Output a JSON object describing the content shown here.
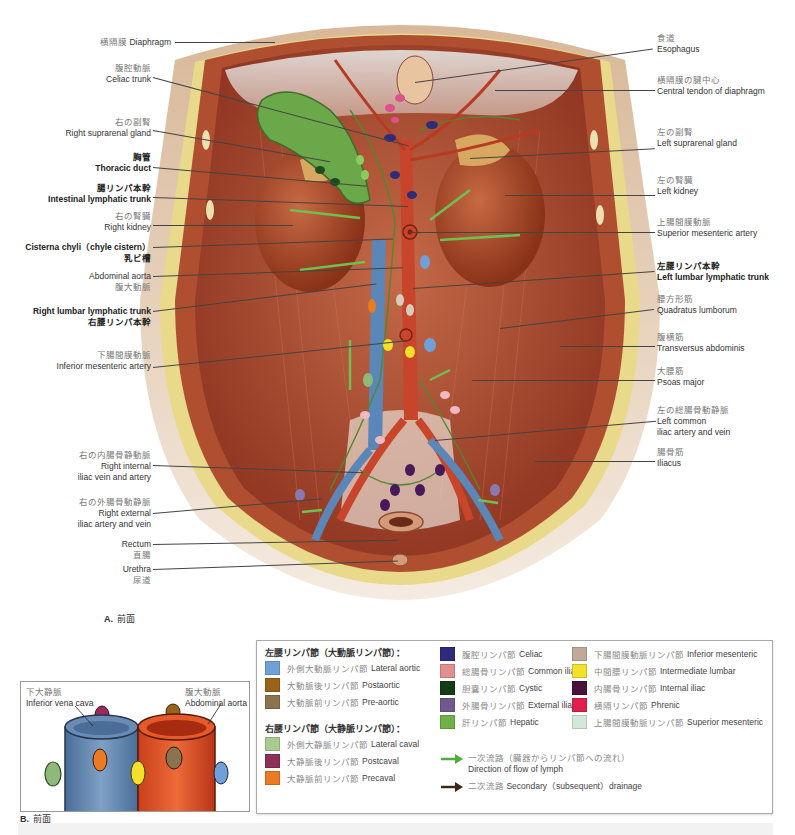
{
  "header": {
    "fragment_colour": "#b04a7a"
  },
  "figure_a": {
    "caption_letter": "A.",
    "caption_text": "前面",
    "left_labels": [
      {
        "jp": "横隔膜",
        "en": "Diaphragm",
        "bold": false,
        "inline": true
      },
      {
        "jp": "腹腔動脈",
        "en": "Celiac trunk",
        "bold": false
      },
      {
        "jp": "右の副腎",
        "en": "Right suprarenal gland",
        "bold": false
      },
      {
        "jp": "胸管",
        "en": "Thoracic duct",
        "bold": true
      },
      {
        "jp": "腸リンパ本幹",
        "en": "Intestinal lymphatic trunk",
        "bold": true
      },
      {
        "jp": "右の腎臓",
        "en": "Right kidney",
        "bold": false
      },
      {
        "en": "Cisterna chyli（chyle cistern）",
        "jp": "乳ビ槽",
        "bold": true,
        "en_first": true
      },
      {
        "en": "Abdominal aorta",
        "jp": "腹大動脈",
        "bold": false,
        "en_first": true
      },
      {
        "en": "Right lumbar lymphatic trunk",
        "jp": "右腰リンパ本幹",
        "bold": true,
        "en_first": true
      },
      {
        "jp": "下腸間膜動脈",
        "en": "Inferior mesenteric artery",
        "bold": false
      },
      {
        "jp": "右の内腸骨静動脈",
        "en": "Right internal",
        "en2": "iliac vein and artery",
        "bold": false
      },
      {
        "jp": "右の外腸骨動静脈",
        "en": "Right external",
        "en2": "iliac artery and vein",
        "bold": false
      },
      {
        "en": "Rectum",
        "jp": "直腸",
        "bold": false,
        "en_first": true
      },
      {
        "en": "Urethra",
        "jp": "尿道",
        "bold": false,
        "en_first": true
      }
    ],
    "right_labels": [
      {
        "jp": "食道",
        "en": "Esophagus",
        "bold": false
      },
      {
        "jp": "横隔膜の腱中心",
        "en": "Central tendon of diaphragm",
        "bold": false
      },
      {
        "jp": "左の副腎",
        "en": "Left suprarenal gland",
        "bold": false
      },
      {
        "jp": "左の腎臓",
        "en": "Left kidney",
        "bold": false
      },
      {
        "jp": "上腸間膜動脈",
        "en": "Superior mesenteric artery",
        "bold": false
      },
      {
        "jp": "左腰リンパ本幹",
        "en": "Left lumbar lymphatic trunk",
        "bold": true
      },
      {
        "jp": "腰方形筋",
        "en": "Quadratus lumborum",
        "bold": false
      },
      {
        "jp": "腹横筋",
        "en": "Transversus abdominis",
        "bold": false
      },
      {
        "jp": "大腰筋",
        "en": "Psoas major",
        "bold": false
      },
      {
        "jp": "左の総腸骨動静脈",
        "en": "Left common",
        "en2": "iliac artery and vein",
        "bold": false
      },
      {
        "jp": "腸骨筋",
        "en": "Iliacus",
        "bold": false
      }
    ]
  },
  "figure_b": {
    "caption_letter": "B.",
    "caption_text": "前面",
    "ivc_jp": "下大静脈",
    "ivc_en": "Inferior vena cava",
    "aorta_jp": "腹大動脈",
    "aorta_en": "Abdominal aorta"
  },
  "legend": {
    "left_group_title": "左腰リンパ節（大動脈リンパ節）：",
    "left_group": [
      {
        "jp": "外側大動脈リンパ節",
        "en": "Lateral aortic",
        "color": "#6fa0d8"
      },
      {
        "jp": "大動脈後リンパ節",
        "en": "Postaortic",
        "color": "#9a6418"
      },
      {
        "jp": "大動脈前リンパ節",
        "en": "Pre-aortic",
        "color": "#8c7350"
      }
    ],
    "right_group_title": "右腰リンパ節（大静脈リンパ節）：",
    "right_group": [
      {
        "jp": "外側大静脈リンパ節",
        "en": "Lateral caval",
        "color": "#a8cc90"
      },
      {
        "jp": "大静脈後リンパ節",
        "en": "Postcaval",
        "color": "#8e2f5a"
      },
      {
        "jp": "大静脈前リンパ節",
        "en": "Precaval",
        "color": "#ec7a22"
      }
    ],
    "middle_column": [
      {
        "jp": "腹腔リンパ節",
        "en": "Celiac",
        "color": "#2e2c7a"
      },
      {
        "jp": "総腸骨リンパ節",
        "en": "Common iliac",
        "color": "#e0908e"
      },
      {
        "jp": "胆嚢リンパ節",
        "en": "Cystic",
        "color": "#143c16"
      },
      {
        "jp": "外腸骨リンパ節",
        "en": "External iliac",
        "color": "#6e5a8e"
      },
      {
        "jp": "肝リンパ節",
        "en": "Hepatic",
        "color": "#6fb048"
      }
    ],
    "right_column": [
      {
        "jp": "下腸間膜動脈リンパ節",
        "en": "Inferior mesenteric",
        "color": "#c2a896"
      },
      {
        "jp": "中間腰リンパ節",
        "en": "Intermediate lumbar",
        "color": "#f2e02a"
      },
      {
        "jp": "内腸骨リンパ節",
        "en": "Internal iliac",
        "color": "#48103a"
      },
      {
        "jp": "横隔リンパ節",
        "en": "Phrenic",
        "color": "#e0204a"
      },
      {
        "jp": "上腸間膜動脈リンパ節",
        "en": "Superior mesenteric",
        "color": "#d4e8da"
      }
    ],
    "arrows": [
      {
        "jp": "一次流路（臓器からリンパ節への流れ）",
        "en": "Direction of flow of lymph",
        "color": "#4cae3a"
      },
      {
        "jp": "二次流路",
        "en": "Secondary（subsequent）drainage",
        "color": "#3a2a1e"
      }
    ]
  },
  "colors": {
    "muscle": "#b9593a",
    "artery": "#c8442a",
    "vein": "#5b86b8",
    "lymph_green": "#6aa84a",
    "fat_yellow": "#e9d98a",
    "skin": "#d2b08c"
  }
}
